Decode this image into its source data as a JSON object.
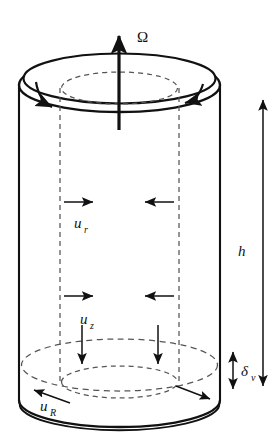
{
  "figure": {
    "type": "technical-diagram",
    "background_color": "#ffffff",
    "line_color": "#111111"
  },
  "labels": {
    "omega": {
      "text": "Ω",
      "name": "angular-velocity",
      "x": 137,
      "y": 40
    },
    "height": {
      "text": "h",
      "name": "cylinder-height",
      "x": 241,
      "y": 250
    },
    "delta": {
      "base": "δ",
      "sub": "v",
      "name": "viscous-boundary-layer-thickness",
      "x": 245,
      "y": 370
    },
    "u_r": {
      "base": "u",
      "sub": "r",
      "name": "radial-velocity",
      "x": 80,
      "y": 226
    },
    "u_z": {
      "base": "u",
      "sub": "z",
      "name": "axial-velocity",
      "x": 86,
      "y": 330
    },
    "u_R": {
      "base": "u",
      "sub": "R",
      "name": "rim-velocity",
      "x": 46,
      "y": 411
    }
  },
  "geometry": {
    "cylinder": {
      "left_wall_x": 19,
      "right_wall_x": 220,
      "top_center_y": 85,
      "bottom_center_y": 400,
      "ellipse_rx": 100.5,
      "ellipse_ry": 27,
      "rim_offset": 7
    },
    "inner_cylinder": {
      "left_x": 60,
      "right_x": 176,
      "center_x": 119.5,
      "rx": 58,
      "ry": 16,
      "top_y": 88,
      "bottom_y": 382
    },
    "boundary_layer": {
      "top_y": 365,
      "bottom_y": 400,
      "thickness_px": 35
    }
  },
  "arrows": {
    "omega_axis": {
      "name": "omega-axis-arrow",
      "x": 119,
      "y_tail": 130,
      "y_head": 32,
      "direction": "up"
    },
    "rotation_left": {
      "name": "rotation-arrow-left",
      "direction": "counterclockwise-from-top"
    },
    "rotation_right": {
      "name": "rotation-arrow-right",
      "direction": "counterclockwise-from-top"
    },
    "radial": [
      {
        "name": "radial-arrow-upper-left",
        "y": 202,
        "x_tail": 64,
        "x_head": 94,
        "direction": "right"
      },
      {
        "name": "radial-arrow-upper-right",
        "y": 202,
        "x_tail": 172,
        "x_head": 144,
        "direction": "left"
      },
      {
        "name": "radial-arrow-lower-left",
        "y": 296,
        "x_tail": 64,
        "x_head": 94,
        "direction": "right"
      },
      {
        "name": "radial-arrow-lower-right",
        "y": 296,
        "x_tail": 172,
        "x_head": 144,
        "direction": "left"
      }
    ],
    "axial": [
      {
        "name": "axial-arrow-left",
        "x": 82,
        "y_tail": 326,
        "y_head": 366,
        "direction": "down"
      },
      {
        "name": "axial-arrow-right",
        "x": 158,
        "y_tail": 326,
        "y_head": 366,
        "direction": "down"
      }
    ],
    "rim": [
      {
        "name": "rim-arrow-left",
        "x_tail": 66,
        "y_tail": 400,
        "x_head": 33,
        "y_head": 388,
        "direction": "down-left"
      },
      {
        "name": "rim-arrow-right",
        "x_tail": 177,
        "y_tail": 388,
        "x_head": 209,
        "y_head": 400,
        "direction": "down-right"
      }
    ],
    "height_measure": {
      "name": "height-dimension-arrow",
      "x": 263,
      "y_top": 100,
      "y_bottom": 385,
      "double_headed": true
    },
    "delta_measure": {
      "name": "delta-dimension-arrow",
      "x": 233,
      "y_top": 352,
      "y_bottom": 388,
      "double_headed": true
    }
  }
}
